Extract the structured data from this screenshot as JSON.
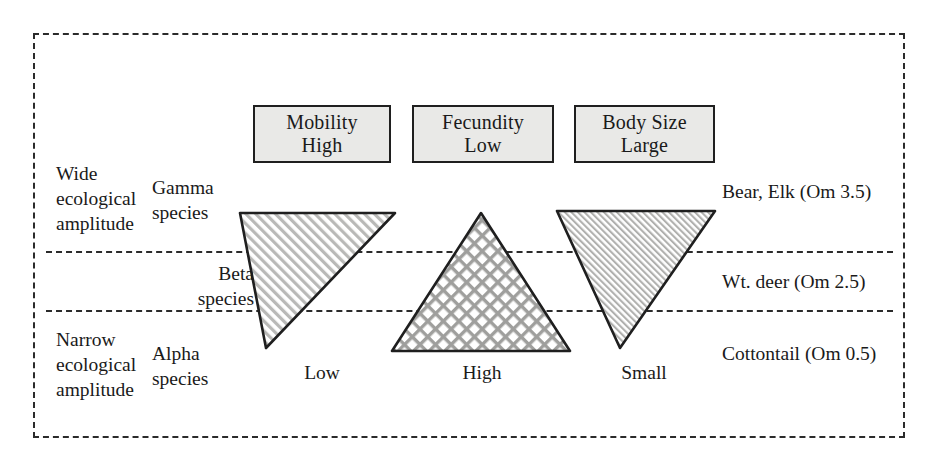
{
  "figure": {
    "attribute_boxes": [
      {
        "name": "mobility",
        "line1": "Mobility",
        "line2": "High"
      },
      {
        "name": "fecundity",
        "line1": "Fecundity",
        "line2": "Low"
      },
      {
        "name": "bodysize",
        "line1": "Body Size",
        "line2": "Large"
      }
    ],
    "left_labels": {
      "wide_amplitude": "Wide\necological\namplitude",
      "narrow_amplitude": "Narrow\necological\namplitude",
      "gamma_species": "Gamma\nspecies",
      "beta_species": "Beta\nspecies",
      "alpha_species": "Alpha\nspecies"
    },
    "right_labels": {
      "gamma_taxon": "Bear, Elk (Om 3.5)",
      "beta_taxon": "Wt. deer (Om 2.5)",
      "alpha_taxon": "Cottontail (Om 0.5)"
    },
    "axis_labels": {
      "mobility": "Low",
      "fecundity": "High",
      "bodysize": "Small"
    },
    "triangles": [
      {
        "name": "mobility-triangle",
        "orientation": "down",
        "fill_pattern": "diagonal-hatch",
        "apex_label": "Low"
      },
      {
        "name": "fecundity-triangle",
        "orientation": "up",
        "fill_pattern": "cross-hatch",
        "apex_label": "High"
      },
      {
        "name": "bodysize-triangle",
        "orientation": "down",
        "fill_pattern": "fine-diagonal-hatch",
        "apex_label": "Small"
      }
    ],
    "colors": {
      "box_fill": "#e9e9e7",
      "stroke": "#1f1f1f",
      "dashed_line": "#2b2b2b",
      "hatch_fill": "#d8d8d6",
      "background": "#ffffff"
    }
  }
}
